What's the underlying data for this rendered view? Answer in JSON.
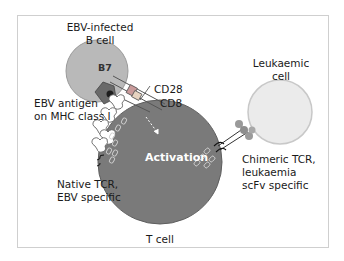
{
  "diagram": {
    "cells": {
      "b_cell": {
        "label_line1": "EBV-infected",
        "label_line2": "B cell",
        "color": "#b9b9b9"
      },
      "t_cell": {
        "label": "T cell",
        "color": "#7a7a7a"
      },
      "leukaemic_cell": {
        "label_line1": "Leukaemic",
        "label_line2": "cell",
        "color": "#e8e8e8"
      }
    },
    "labels": {
      "b7": "B7",
      "cd28": "CD28",
      "cd8": "CD8",
      "ebv_antigen_line1": "EBV antigen",
      "ebv_antigen_line2": "on MHC class I",
      "activation": "Activation",
      "native_tcr_line1": "Native TCR,",
      "native_tcr_line2": "EBV specific",
      "chimeric_tcr_line1": "Chimeric TCR,",
      "chimeric_tcr_line2": "leukaemia",
      "chimeric_tcr_line3": "scFv specific"
    },
    "colors": {
      "frame": "#cfcfcf",
      "mhc": "#6f6f6f",
      "antigen": "#222222",
      "cd28_box": "#c08a8a",
      "scfv": "#9a9a9a"
    }
  }
}
